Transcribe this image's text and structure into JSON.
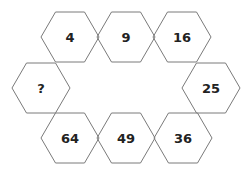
{
  "puzzle": {
    "stroke_color": "#7a7a7a",
    "text_color": "#222222",
    "hexagons": [
      {
        "label": "4",
        "cx": 70,
        "cy": 37
      },
      {
        "label": "9",
        "cx": 126,
        "cy": 37
      },
      {
        "label": "16",
        "cx": 182,
        "cy": 37
      },
      {
        "label": "25",
        "cx": 211,
        "cy": 88
      },
      {
        "label": "36",
        "cx": 183,
        "cy": 138
      },
      {
        "label": "49",
        "cx": 126,
        "cy": 138
      },
      {
        "label": "64",
        "cx": 70,
        "cy": 138
      },
      {
        "label": "?",
        "cx": 41,
        "cy": 88
      }
    ]
  }
}
